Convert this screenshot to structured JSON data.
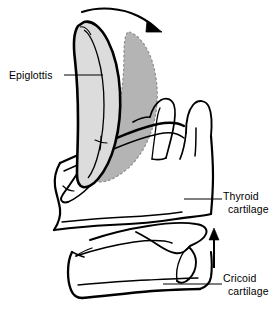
{
  "figure": {
    "background_color": "#ffffff",
    "ink_color": "#000000"
  },
  "labels": {
    "epiglottis": {
      "text": "Epiglottis",
      "leader": "leader-line-horizontal"
    },
    "thyroid": {
      "line1": "Thyroid",
      "line2": "cartilage",
      "leader": "leader-line-horizontal"
    },
    "cricoid": {
      "line1": "Cricoid",
      "line2": "cartilage",
      "leader": "leader-line-horizontal"
    }
  },
  "structures": {
    "epiglottis_upright": {
      "name": "epiglottis-upright-shape",
      "fill": "#dcdcdc",
      "stroke": "#000000",
      "stroke_style": "solid",
      "description": "Light gray epiglottis in erect position with heavy black outline"
    },
    "epiglottis_folded": {
      "name": "epiglottis-displaced-shape",
      "fill": "#b4b4b4",
      "stroke": "#808080",
      "stroke_style": "dashed",
      "description": "Darker gray epiglottis in folded-back position with dashed outline"
    },
    "thyroid_cartilage": {
      "name": "thyroid-cartilage-outline",
      "fill": "none",
      "stroke": "#000000",
      "description": "Thyroid cartilage body with superior and inferior horns"
    },
    "cricoid_cartilage": {
      "name": "cricoid-cartilage-outline",
      "fill": "none",
      "stroke": "#000000",
      "description": "Cricoid cartilage ring below thyroid cartilage"
    }
  },
  "arrows": {
    "curved_motion_arrow": {
      "name": "epiglottis-motion-arrow",
      "direction": "left-to-right-curved-down",
      "color": "#000000"
    },
    "vertical_elevation_arrow": {
      "name": "larynx-elevation-arrow",
      "direction": "up",
      "color": "#000000"
    }
  }
}
